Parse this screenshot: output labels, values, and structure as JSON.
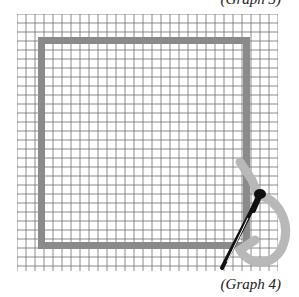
{
  "caption": "(Graph 4)",
  "top_caption_fragment": "(Graph 3)",
  "diagram": {
    "type": "graph-paper drawing",
    "grid": {
      "columns": 29,
      "rows": 28,
      "cell_px": 9,
      "line_color": "#6f6f6f"
    },
    "square_frame": {
      "color": "#8a8a8a",
      "thickness_px": 7
    },
    "tool": "pen tracing a curved loop at the bottom-right corner",
    "loop_color": "#b8b8b8",
    "pen_color": "#111111"
  }
}
